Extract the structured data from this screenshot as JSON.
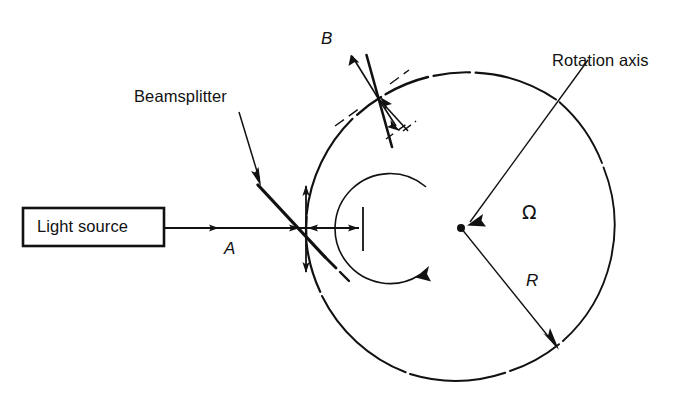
{
  "figure": {
    "domain": "Diagram",
    "background_color": "#ffffff",
    "stroke_color": "#111111",
    "width": 692,
    "height": 409
  },
  "labels": {
    "beamsplitter": "Beamsplitter",
    "light_source": "Light source",
    "rotation_axis": "Rotation axis",
    "beam_a": "A",
    "beam_b": "B",
    "radius": "R",
    "angular_velocity": "Ω"
  },
  "geometry": {
    "circle": {
      "cx": 461,
      "cy": 228,
      "r": 156
    },
    "rotation_arc": {
      "cx": 461,
      "cy": 228,
      "r": 55
    },
    "center_dot": {
      "cx": 461,
      "cy": 228,
      "r": 3.6
    },
    "beamsplitter_point": {
      "x": 306,
      "y": 228
    },
    "mirror_b_point": {
      "x": 378,
      "y": 98
    },
    "source_box": {
      "x": 23,
      "y": 208,
      "w": 141,
      "h": 38
    },
    "detector_tick": {
      "x": 363,
      "y1": 207,
      "y2": 251
    },
    "radius_arrow": {
      "x1": 461,
      "y1": 228,
      "x2": 558,
      "y2": 349
    },
    "axis_leader": {
      "x1": 563,
      "y1": 70,
      "x2": 468,
      "y2": 222
    }
  },
  "elements": {
    "source_box_name": "light-source-box",
    "beam_a_name": "beam-a-arrow",
    "beam_b_name": "beam-b-arrow",
    "beamsplitter_name": "beamsplitter-mirror",
    "mirror_b_name": "mirror-b",
    "ring_name": "interferometer-ring",
    "rotation_arc_name": "rotation-direction-arc"
  }
}
